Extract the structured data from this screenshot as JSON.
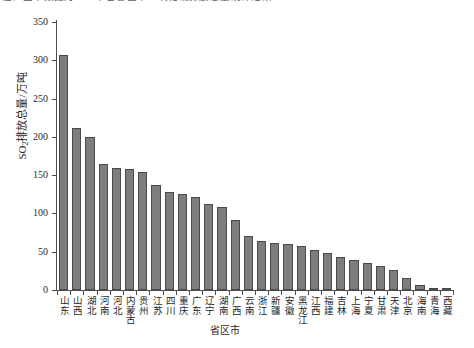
{
  "clipped_header": {
    "text": "注：图中数据为2005年各省区市二氧化硫排放总量统计结果"
  },
  "chart_data": {
    "type": "bar",
    "title": "",
    "subtitle": "",
    "xlabel": "省区市",
    "ylabel": "SO₂排放总量/万吨",
    "ylabel_parts": {
      "prefix": "SO",
      "subscript": "2",
      "suffix": "排放总量/万吨"
    },
    "ylim": [
      0,
      350
    ],
    "ytick_values": [
      0,
      50,
      100,
      150,
      200,
      250,
      300,
      350
    ],
    "ytick_labels": [
      "0",
      "50",
      "100",
      "150",
      "200",
      "250",
      "300",
      "350"
    ],
    "grid": false,
    "legend": null,
    "bar_color": "#7d7d7d",
    "bar_edge_color": "#4a4a4a",
    "axis_color": "#4d4d4d",
    "categories": [
      "山东",
      "山西",
      "湖北",
      "河南",
      "河北",
      "内蒙古",
      "贵州",
      "江苏",
      "四川",
      "重庆",
      "广东",
      "辽宁",
      "湖南",
      "广西",
      "云南",
      "浙江",
      "新疆",
      "安徽",
      "黑龙江",
      "江西",
      "福建",
      "吉林",
      "上海",
      "宁夏",
      "甘肃",
      "天津",
      "北京",
      "海南",
      "青海",
      "西藏"
    ],
    "values": [
      307,
      211,
      200,
      165,
      159,
      158,
      154,
      137,
      128,
      125,
      122,
      112,
      108,
      91,
      70,
      64,
      62,
      60,
      57,
      52,
      48,
      43,
      39,
      35,
      31,
      26,
      16,
      7,
      3,
      2
    ]
  }
}
